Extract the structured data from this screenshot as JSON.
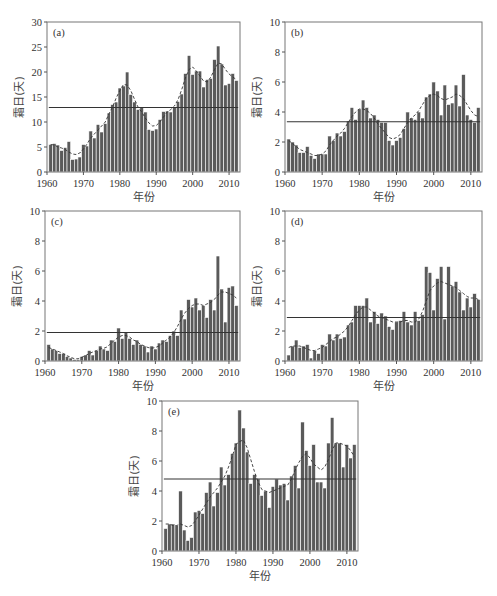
{
  "figure": {
    "xlabel": "年份",
    "ylabel": "霜日(天)",
    "bar_color": "#5a5a5a",
    "bar_edge_color": "#ffffff",
    "mean_line_color": "#333333",
    "smooth_line_color": "#333333"
  },
  "chart_data": [
    {
      "id": "a",
      "type": "bar",
      "title": "(a)",
      "xlabel": "年份",
      "ylabel": "霜日(天)",
      "xlim": [
        1960,
        2013
      ],
      "ylim": [
        0,
        30
      ],
      "yticks": [
        0,
        5,
        10,
        15,
        20,
        25,
        30
      ],
      "xticks": [
        1960,
        1970,
        1980,
        1990,
        2000,
        2010
      ],
      "years_start": 1961,
      "values": [
        5.5,
        5.7,
        5.4,
        4.3,
        4.9,
        6.1,
        2.5,
        2.6,
        3.0,
        5.5,
        5.2,
        8.2,
        6.8,
        9.5,
        8.0,
        9.7,
        11.8,
        13.5,
        14.0,
        16.8,
        17.2,
        20.0,
        15.5,
        14.0,
        12.5,
        13.0,
        12.0,
        8.5,
        8.3,
        8.6,
        10.5,
        12.1,
        12.2,
        12.0,
        13.0,
        14.1,
        15.6,
        19.7,
        23.3,
        19.5,
        20.2,
        20.2,
        17.0,
        18.5,
        18.7,
        22.5,
        25.2,
        21.6,
        17.4,
        17.7,
        19.7,
        18.3
      ],
      "mean": 12.9,
      "smooth": [
        5.5,
        5.4,
        5.0,
        4.8,
        4.5,
        4.0,
        3.6,
        3.5,
        3.8,
        4.6,
        5.6,
        6.8,
        7.6,
        8.4,
        9.2,
        10.0,
        11.6,
        13.0,
        14.8,
        16.3,
        17.5,
        17.4,
        16.3,
        14.6,
        13.0,
        12.0,
        10.8,
        9.8,
        9.2,
        9.3,
        10.0,
        11.0,
        12.0,
        12.5,
        13.2,
        14.5,
        16.5,
        18.8,
        20.5,
        21.0,
        20.2,
        19.2,
        18.2,
        18.0,
        19.0,
        20.5,
        21.8,
        21.6,
        20.5,
        19.6,
        19.0,
        18.5
      ]
    },
    {
      "id": "b",
      "type": "bar",
      "title": "(b)",
      "xlabel": "年份",
      "ylabel": "霜日(天)",
      "xlim": [
        1960,
        2013
      ],
      "ylim": [
        0,
        10
      ],
      "yticks": [
        0,
        2,
        4,
        6,
        8,
        10
      ],
      "xticks": [
        1960,
        1970,
        1980,
        1990,
        2000,
        2010
      ],
      "years_start": 1961,
      "values": [
        2.2,
        2.0,
        1.8,
        1.3,
        1.3,
        1.7,
        1.1,
        0.9,
        1.2,
        1.2,
        1.2,
        2.4,
        2.1,
        2.6,
        2.4,
        2.7,
        3.4,
        4.3,
        3.5,
        4.2,
        4.8,
        4.3,
        3.6,
        3.8,
        3.5,
        3.3,
        3.3,
        2.1,
        1.8,
        2.1,
        2.3,
        2.9,
        4.0,
        3.6,
        3.5,
        4.0,
        3.6,
        5.0,
        5.2,
        6.0,
        5.4,
        3.8,
        5.8,
        4.5,
        4.6,
        5.8,
        4.4,
        6.5,
        3.8,
        3.5,
        3.3,
        4.3
      ],
      "mean": 3.35,
      "smooth": [
        2.1,
        1.9,
        1.7,
        1.5,
        1.4,
        1.3,
        1.2,
        1.1,
        1.1,
        1.2,
        1.4,
        1.8,
        2.1,
        2.4,
        2.6,
        2.9,
        3.3,
        3.7,
        4.0,
        4.2,
        4.2,
        4.1,
        3.9,
        3.6,
        3.2,
        2.9,
        2.6,
        2.3,
        2.2,
        2.3,
        2.5,
        2.9,
        3.3,
        3.6,
        3.8,
        4.1,
        4.5,
        4.9,
        5.1,
        5.2,
        5.1,
        4.9,
        4.8,
        4.9,
        5.0,
        5.2,
        5.1,
        4.9,
        4.5,
        4.1,
        3.8,
        3.7
      ]
    },
    {
      "id": "c",
      "type": "bar",
      "title": "(c)",
      "xlabel": "年份",
      "ylabel": "霜日(天)",
      "xlim": [
        1960,
        2013
      ],
      "ylim": [
        0,
        10
      ],
      "yticks": [
        0,
        2,
        4,
        6,
        8,
        10
      ],
      "xticks": [
        1960,
        1970,
        1980,
        1990,
        2000,
        2010
      ],
      "years_start": 1961,
      "values": [
        1.1,
        0.8,
        0.7,
        0.5,
        0.5,
        0.3,
        0.2,
        0.1,
        0.1,
        0.3,
        0.4,
        0.7,
        0.4,
        0.7,
        1.0,
        0.8,
        0.7,
        1.4,
        1.3,
        2.2,
        1.5,
        1.9,
        1.5,
        1.1,
        1.4,
        1.1,
        1.0,
        0.6,
        1.0,
        0.8,
        1.2,
        1.4,
        1.3,
        1.7,
        2.0,
        1.7,
        3.4,
        2.8,
        4.1,
        3.6,
        4.2,
        3.4,
        3.7,
        2.9,
        4.1,
        3.4,
        7.0,
        4.8,
        2.6,
        4.9,
        5.0,
        3.7
      ],
      "mean": 1.9,
      "smooth": [
        0.9,
        0.8,
        0.7,
        0.6,
        0.5,
        0.35,
        0.25,
        0.15,
        0.15,
        0.25,
        0.35,
        0.5,
        0.6,
        0.7,
        0.8,
        0.85,
        0.95,
        1.2,
        1.4,
        1.6,
        1.7,
        1.7,
        1.6,
        1.4,
        1.3,
        1.1,
        1.0,
        0.9,
        0.85,
        0.9,
        1.0,
        1.2,
        1.4,
        1.6,
        1.9,
        2.3,
        2.8,
        3.2,
        3.5,
        3.7,
        3.8,
        3.8,
        3.7,
        3.8,
        3.9,
        4.1,
        4.4,
        4.6,
        4.6,
        4.5,
        4.4,
        4.2
      ]
    },
    {
      "id": "d",
      "type": "bar",
      "title": "(d)",
      "xlabel": "年份",
      "ylabel": "霜日(天)",
      "xlim": [
        1960,
        2013
      ],
      "ylim": [
        0,
        10
      ],
      "yticks": [
        0,
        2,
        4,
        6,
        8,
        10
      ],
      "xticks": [
        1960,
        1970,
        1980,
        1990,
        2000,
        2010
      ],
      "years_start": 1961,
      "values": [
        0.4,
        1.0,
        1.4,
        0.9,
        1.0,
        1.1,
        0.2,
        0.7,
        0.5,
        1.1,
        1.0,
        1.8,
        1.4,
        1.8,
        1.5,
        1.6,
        2.4,
        2.6,
        3.7,
        3.7,
        3.7,
        4.2,
        2.6,
        3.3,
        2.5,
        3.2,
        3.0,
        2.3,
        2.1,
        2.6,
        2.7,
        3.3,
        2.6,
        2.4,
        3.3,
        2.7,
        3.1,
        6.3,
        5.9,
        3.4,
        5.5,
        6.3,
        2.8,
        6.3,
        5.0,
        5.3,
        4.6,
        3.4,
        4.2,
        3.6,
        4.5,
        4.1
      ],
      "mean": 2.9,
      "smooth": [
        0.9,
        1.0,
        1.0,
        1.0,
        0.9,
        0.8,
        0.7,
        0.7,
        0.8,
        0.9,
        1.1,
        1.3,
        1.5,
        1.6,
        1.8,
        2.0,
        2.3,
        2.7,
        3.1,
        3.4,
        3.6,
        3.6,
        3.4,
        3.2,
        3.0,
        2.9,
        2.8,
        2.7,
        2.6,
        2.6,
        2.6,
        2.7,
        2.7,
        2.6,
        2.6,
        2.8,
        3.3,
        4.0,
        4.7,
        5.0,
        5.2,
        5.3,
        5.2,
        5.1,
        5.0,
        4.9,
        4.7,
        4.5,
        4.3,
        4.2,
        4.2,
        4.1
      ]
    },
    {
      "id": "e",
      "type": "bar",
      "title": "(e)",
      "xlabel": "年份",
      "ylabel": "霜日(天)",
      "xlim": [
        1960,
        2013
      ],
      "ylim": [
        0,
        10
      ],
      "yticks": [
        0,
        2,
        4,
        6,
        8,
        10
      ],
      "xticks": [
        1960,
        1970,
        1980,
        1990,
        2000,
        2010
      ],
      "years_start": 1961,
      "values": [
        1.5,
        1.8,
        1.8,
        1.7,
        4.0,
        1.4,
        0.7,
        0.9,
        2.6,
        2.7,
        2.5,
        3.9,
        4.6,
        3.0,
        3.9,
        5.6,
        4.4,
        5.1,
        6.5,
        7.2,
        9.4,
        8.2,
        6.6,
        4.5,
        5.1,
        4.8,
        3.7,
        4.0,
        2.9,
        4.3,
        4.8,
        4.4,
        4.5,
        3.4,
        5.0,
        5.7,
        4.2,
        8.6,
        6.7,
        5.7,
        7.1,
        4.6,
        4.6,
        4.2,
        7.2,
        8.9,
        7.2,
        7.2,
        5.6,
        7.1,
        6.2,
        7.1
      ],
      "mean": 4.8,
      "smooth": [
        1.8,
        1.8,
        1.7,
        1.7,
        1.8,
        1.7,
        1.6,
        1.7,
        2.0,
        2.4,
        2.8,
        3.2,
        3.6,
        3.9,
        4.2,
        4.6,
        5.0,
        5.6,
        6.3,
        7.1,
        7.3,
        7.4,
        6.9,
        6.1,
        5.3,
        4.6,
        4.1,
        4.0,
        3.9,
        4.0,
        4.1,
        4.2,
        4.3,
        4.4,
        4.8,
        5.4,
        5.9,
        6.3,
        6.5,
        6.2,
        5.8,
        5.6,
        5.4,
        5.6,
        6.1,
        6.7,
        7.2,
        7.2,
        7.1,
        7.0,
        6.7,
        6.3
      ]
    }
  ]
}
